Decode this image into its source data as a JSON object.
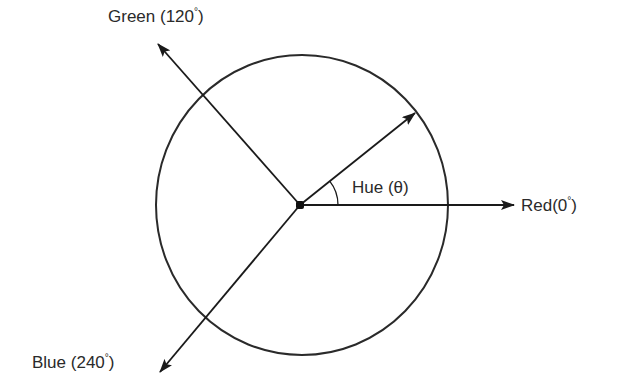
{
  "diagram": {
    "labels": {
      "green": {
        "name": "Green",
        "angle": "120",
        "text": "Green (120°)"
      },
      "red": {
        "name": "Red",
        "angle": "0",
        "text": "Red(0°)"
      },
      "blue": {
        "name": "Blue",
        "angle": "240",
        "text": "Blue (240°)"
      },
      "hue": {
        "text": "Hue (θ)"
      }
    },
    "colors": {
      "stroke": "#1a1a1a",
      "text": "#2a2a2a",
      "background": "#ffffff"
    }
  }
}
